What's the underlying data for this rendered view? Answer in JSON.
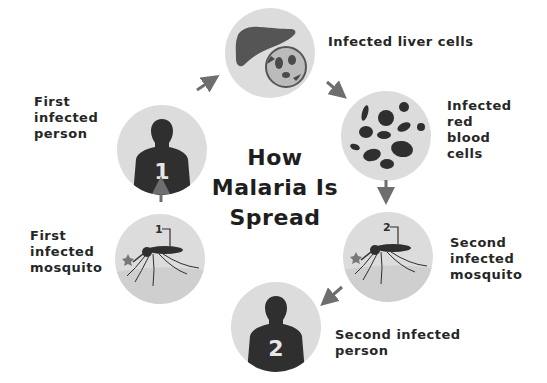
{
  "diagram": {
    "title_lines": [
      "How",
      "Malaria Is",
      "Spread"
    ],
    "colors": {
      "circle_fill": "#dcdcdc",
      "silhouette": "#2f2f2f",
      "arrow": "#6e6e6e",
      "text": "#262626"
    },
    "steps": [
      {
        "id": "first-person",
        "label": "First\ninfected\nperson",
        "badge": "1",
        "icon": "person-silhouette-icon"
      },
      {
        "id": "liver",
        "label": "Infected liver cells",
        "icon": "liver-cell-icon"
      },
      {
        "id": "rbc",
        "label": "Infected\nred\nblood\ncells",
        "icon": "red-blood-cells-icon"
      },
      {
        "id": "second-mosquito",
        "label": "Second\ninfected\nmosquito",
        "badge": "2",
        "icon": "mosquito-icon"
      },
      {
        "id": "second-person",
        "label": "Second infected\nperson",
        "badge": "2",
        "icon": "person-silhouette-icon"
      },
      {
        "id": "first-mosquito",
        "label": "First\ninfected\nmosquito",
        "badge": "1",
        "icon": "mosquito-icon"
      }
    ],
    "flow": [
      "first-person",
      "liver",
      "rbc",
      "second-mosquito",
      "second-person"
    ],
    "loop": [
      "first-mosquito",
      "first-person"
    ]
  }
}
